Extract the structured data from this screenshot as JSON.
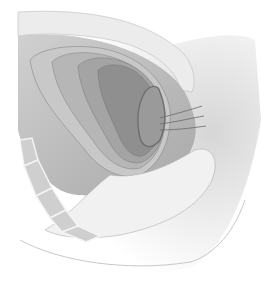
{
  "image": {
    "type": "anatomical-illustration",
    "subject": "sagittal pelvic cross-section with nested outlined organ contours",
    "palette": {
      "background": "#ffffff",
      "skin_light": "#e6e6e6",
      "cavity_mid": "#bdbdbd",
      "layer_1": "#cfcfcf",
      "layer_2": "#b8b8b8",
      "layer_3": "#a3a3a3",
      "layer_4": "#8f8f8f",
      "organ_core": "#9a9a9a",
      "bone": "#d2d2d2",
      "outline": "#7a7a7a"
    }
  }
}
